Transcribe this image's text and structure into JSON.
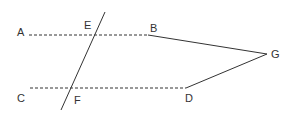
{
  "diagram": {
    "type": "geometry",
    "points": {
      "A": {
        "label": "A",
        "x": 29,
        "y": 35,
        "label_x": 17,
        "label_y": 34
      },
      "B": {
        "label": "B",
        "x": 148,
        "y": 35,
        "label_x": 150,
        "label_y": 30
      },
      "C": {
        "label": "C",
        "x": 30,
        "y": 88,
        "label_x": 17,
        "label_y": 102
      },
      "D": {
        "label": "D",
        "x": 186,
        "y": 88,
        "label_x": 185,
        "label_y": 101
      },
      "E": {
        "label": "E",
        "x": 96,
        "y": 35,
        "label_x": 84,
        "label_y": 28
      },
      "F": {
        "label": "F",
        "x": 72,
        "y": 88,
        "label_x": 74,
        "label_y": 104
      },
      "G": {
        "label": "G",
        "x": 267,
        "y": 54,
        "label_x": 271,
        "label_y": 58
      }
    },
    "lines": [
      {
        "id": "AB",
        "from": "A",
        "to": "B",
        "style": "dashed"
      },
      {
        "id": "CD",
        "from": "C",
        "to": "D",
        "style": "dashed"
      },
      {
        "id": "BG",
        "from": "B",
        "to": "G",
        "style": "solid"
      },
      {
        "id": "DG",
        "from": "D",
        "to": "G",
        "style": "solid"
      },
      {
        "id": "transversal",
        "through": [
          "E",
          "F"
        ],
        "x1": 105,
        "y1": 12,
        "x2": 61,
        "y2": 110,
        "style": "solid"
      }
    ],
    "colors": {
      "line": "#333333",
      "label": "#333333",
      "background": "#ffffff"
    }
  }
}
